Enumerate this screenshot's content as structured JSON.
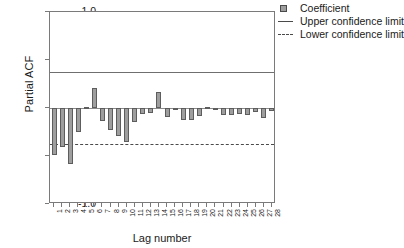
{
  "chart_data": {
    "type": "bar",
    "title": "",
    "xlabel": "Lag number",
    "ylabel": "Partial ACF",
    "ylim": [
      -1.0,
      1.0
    ],
    "yticks": [
      "1.0",
      "0.5",
      "0.0",
      "-0.5",
      "-1.0"
    ],
    "ytick_values": [
      1.0,
      0.5,
      0.0,
      -0.5,
      -1.0
    ],
    "grid": false,
    "legend_position": "top-right",
    "categories": [
      "1",
      "2",
      "3",
      "4",
      "5",
      "6",
      "7",
      "8",
      "9",
      "10",
      "11",
      "12",
      "13",
      "14",
      "15",
      "16",
      "17",
      "18",
      "19",
      "20",
      "21",
      "22",
      "23",
      "24",
      "25",
      "26",
      "27",
      "28"
    ],
    "values": [
      -0.49,
      -0.41,
      -0.58,
      -0.25,
      0.01,
      0.21,
      -0.14,
      -0.23,
      -0.29,
      -0.35,
      -0.15,
      -0.06,
      -0.05,
      0.17,
      -0.09,
      -0.01,
      -0.12,
      -0.13,
      -0.08,
      0.01,
      -0.01,
      -0.07,
      -0.07,
      -0.06,
      -0.07,
      -0.04,
      -0.1,
      -0.03
    ],
    "upper_confidence_limit": 0.38,
    "lower_confidence_limit": -0.38,
    "series": [
      {
        "name": "Coefficient",
        "values": [
          -0.49,
          -0.41,
          -0.58,
          -0.25,
          0.01,
          0.21,
          -0.14,
          -0.23,
          -0.29,
          -0.35,
          -0.15,
          -0.06,
          -0.05,
          0.17,
          -0.09,
          -0.01,
          -0.12,
          -0.13,
          -0.08,
          0.01,
          -0.01,
          -0.07,
          -0.07,
          -0.06,
          -0.07,
          -0.04,
          -0.1,
          -0.03
        ]
      }
    ],
    "colors": {
      "bar_fill": "#9e9e9e",
      "bar_edge": "#5d5d5d",
      "axis": "#7a7a7a",
      "upper_limit": "#6f6f6f",
      "lower_limit": "#4a4a4a"
    }
  },
  "legend": {
    "items": [
      {
        "label": "Coefficient",
        "marker": "square-swatch-icon"
      },
      {
        "label": "Upper confidence limit",
        "marker": "solid-line-icon"
      },
      {
        "label": "Lower confidence limit",
        "marker": "dashed-line-icon"
      }
    ]
  }
}
